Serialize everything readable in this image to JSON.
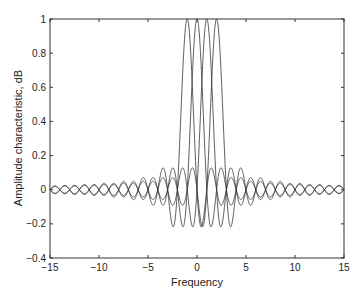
{
  "chart_data": {
    "type": "line",
    "title": "",
    "xlabel": "Frequency",
    "ylabel": "Amplitude characteristic, dB",
    "xlim": [
      -15,
      15
    ],
    "ylim": [
      -0.4,
      1
    ],
    "xticks": [
      -15,
      -10,
      -5,
      0,
      5,
      10,
      15
    ],
    "yticks": [
      -0.4,
      -0.2,
      0,
      0.2,
      0.4,
      0.6,
      0.8,
      1
    ],
    "xtick_labels": [
      "−15",
      "−10",
      "−5",
      "0",
      "5",
      "10",
      "15"
    ],
    "ytick_labels": [
      "−0.4",
      "−0.2",
      "0",
      "0.2",
      "0.4",
      "0.6",
      "0.8",
      "1"
    ],
    "grid": false,
    "legend": null,
    "series": [
      {
        "name": "sinc centered at -1",
        "function": "sin(pi*(f+1))/(pi*(f+1))",
        "center": -1,
        "peak": 1,
        "min": -0.217
      },
      {
        "name": "sinc centered at 0",
        "function": "sin(pi*f)/(pi*f)",
        "center": 0,
        "peak": 1,
        "min": -0.217
      },
      {
        "name": "sinc centered at 1",
        "function": "sin(pi*(f-1))/(pi*(f-1))",
        "center": 1,
        "peak": 1,
        "min": -0.217
      },
      {
        "name": "sinc centered at 2",
        "function": "sin(pi*(f-2))/(pi*(f-2))",
        "center": 2,
        "peak": 1,
        "min": -0.217
      }
    ],
    "line_color": "#333333"
  }
}
